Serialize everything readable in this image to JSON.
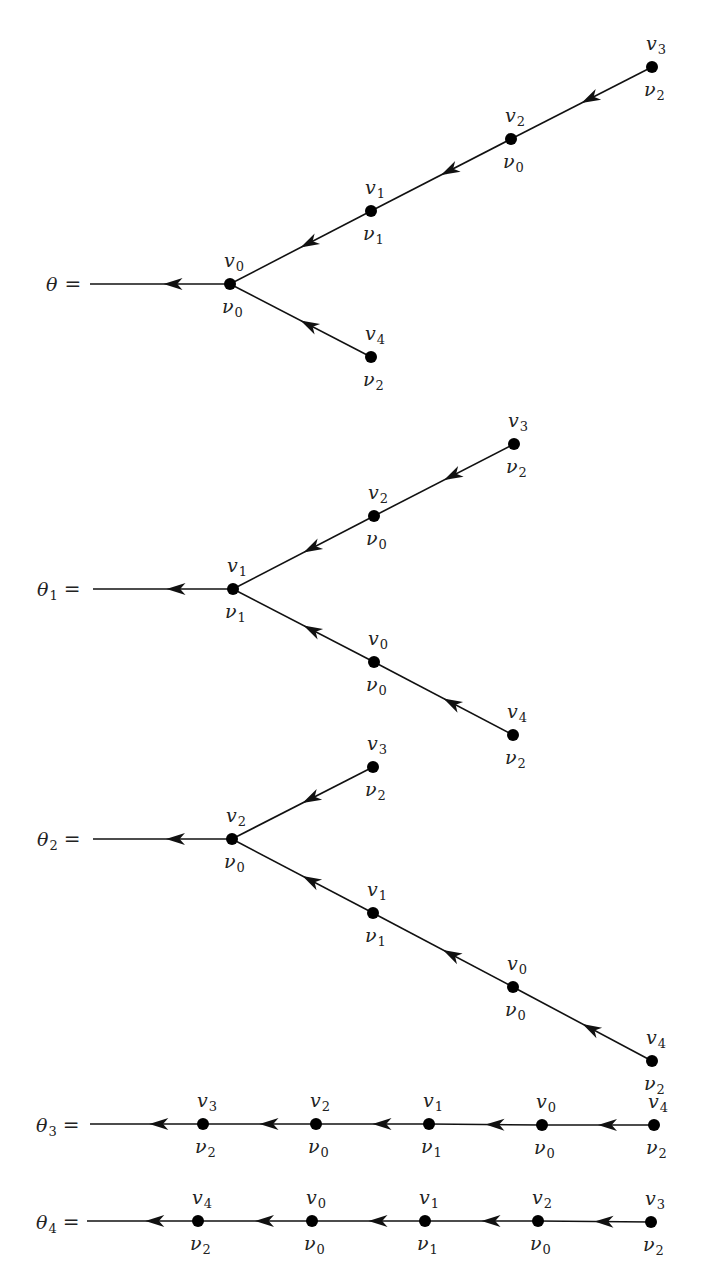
{
  "figure": {
    "colors": {
      "line": "#111111",
      "node": "#000000",
      "text": "#222222",
      "background": "#ffffff"
    },
    "node_radius": 6,
    "trees": [
      {
        "name": "theta",
        "label": {
          "symbol": "θ",
          "subscript": "",
          "eq": "=",
          "x": 46,
          "y": 291
        },
        "line_start": [
          90,
          284
        ],
        "nodes": [
          {
            "id": "v0",
            "x": 230,
            "y": 284,
            "top": {
              "symbol": "v",
              "sub": "0"
            },
            "bottom": {
              "symbol": "ν",
              "sub": "0"
            }
          },
          {
            "id": "v1",
            "x": 371,
            "y": 211,
            "top": {
              "symbol": "v",
              "sub": "1"
            },
            "bottom": {
              "symbol": "ν",
              "sub": "1"
            }
          },
          {
            "id": "v2",
            "x": 511,
            "y": 139,
            "top": {
              "symbol": "v",
              "sub": "2"
            },
            "bottom": {
              "symbol": "ν",
              "sub": "0"
            }
          },
          {
            "id": "v3",
            "x": 652,
            "y": 67,
            "top": {
              "symbol": "v",
              "sub": "3"
            },
            "bottom": {
              "symbol": "ν",
              "sub": "2"
            }
          },
          {
            "id": "v4",
            "x": 371,
            "y": 357,
            "top": {
              "symbol": "v",
              "sub": "4"
            },
            "bottom": {
              "symbol": "ν",
              "sub": "2"
            }
          }
        ],
        "edges": [
          {
            "from": "v1",
            "to": "v0"
          },
          {
            "from": "v2",
            "to": "v1"
          },
          {
            "from": "v3",
            "to": "v2"
          },
          {
            "from": "v4",
            "to": "v0"
          }
        ],
        "root": "v0"
      },
      {
        "name": "theta-1",
        "label": {
          "symbol": "θ",
          "subscript": "1",
          "eq": "=",
          "x": 37,
          "y": 596
        },
        "line_start": [
          93,
          589
        ],
        "nodes": [
          {
            "id": "v1",
            "x": 233,
            "y": 589,
            "top": {
              "symbol": "v",
              "sub": "1"
            },
            "bottom": {
              "symbol": "ν",
              "sub": "1"
            }
          },
          {
            "id": "v2",
            "x": 374,
            "y": 516,
            "top": {
              "symbol": "v",
              "sub": "2"
            },
            "bottom": {
              "symbol": "ν",
              "sub": "0"
            }
          },
          {
            "id": "v3",
            "x": 514,
            "y": 444,
            "top": {
              "symbol": "v",
              "sub": "3"
            },
            "bottom": {
              "symbol": "ν",
              "sub": "2"
            }
          },
          {
            "id": "v0",
            "x": 374,
            "y": 662,
            "top": {
              "symbol": "v",
              "sub": "0"
            },
            "bottom": {
              "symbol": "ν",
              "sub": "0"
            }
          },
          {
            "id": "v4",
            "x": 513,
            "y": 735,
            "top": {
              "symbol": "v",
              "sub": "4"
            },
            "bottom": {
              "symbol": "ν",
              "sub": "2"
            }
          }
        ],
        "edges": [
          {
            "from": "v2",
            "to": "v1"
          },
          {
            "from": "v3",
            "to": "v2"
          },
          {
            "from": "v0",
            "to": "v1"
          },
          {
            "from": "v4",
            "to": "v0"
          }
        ],
        "root": "v1"
      },
      {
        "name": "theta-2",
        "label": {
          "symbol": "θ",
          "subscript": "2",
          "eq": "=",
          "x": 37,
          "y": 846
        },
        "line_start": [
          93,
          839
        ],
        "nodes": [
          {
            "id": "v2",
            "x": 232,
            "y": 839,
            "top": {
              "symbol": "v",
              "sub": "2"
            },
            "bottom": {
              "symbol": "ν",
              "sub": "0"
            }
          },
          {
            "id": "v3",
            "x": 373,
            "y": 767,
            "top": {
              "symbol": "v",
              "sub": "3"
            },
            "bottom": {
              "symbol": "ν",
              "sub": "2"
            }
          },
          {
            "id": "v1",
            "x": 373,
            "y": 913,
            "top": {
              "symbol": "v",
              "sub": "1"
            },
            "bottom": {
              "symbol": "ν",
              "sub": "1"
            }
          },
          {
            "id": "v0",
            "x": 513,
            "y": 987,
            "top": {
              "symbol": "v",
              "sub": "0"
            },
            "bottom": {
              "symbol": "ν",
              "sub": "0"
            }
          },
          {
            "id": "v4",
            "x": 652,
            "y": 1061,
            "top": {
              "symbol": "v",
              "sub": "4"
            },
            "bottom": {
              "symbol": "ν",
              "sub": "2"
            }
          }
        ],
        "edges": [
          {
            "from": "v3",
            "to": "v2"
          },
          {
            "from": "v1",
            "to": "v2"
          },
          {
            "from": "v0",
            "to": "v1"
          },
          {
            "from": "v4",
            "to": "v0"
          }
        ],
        "root": "v2"
      },
      {
        "name": "theta-3",
        "label": {
          "symbol": "θ",
          "subscript": "3",
          "eq": "=",
          "x": 36,
          "y": 1132
        },
        "line_start": [
          90,
          1124
        ],
        "nodes": [
          {
            "id": "v3",
            "x": 203,
            "y": 1124,
            "top": {
              "symbol": "v",
              "sub": "3"
            },
            "bottom": {
              "symbol": "ν",
              "sub": "2"
            }
          },
          {
            "id": "v2",
            "x": 316,
            "y": 1124,
            "top": {
              "symbol": "v",
              "sub": "2"
            },
            "bottom": {
              "symbol": "ν",
              "sub": "0"
            }
          },
          {
            "id": "v1",
            "x": 429,
            "y": 1124,
            "top": {
              "symbol": "v",
              "sub": "1"
            },
            "bottom": {
              "symbol": "ν",
              "sub": "1"
            }
          },
          {
            "id": "v0",
            "x": 542,
            "y": 1125,
            "top": {
              "symbol": "v",
              "sub": "0"
            },
            "bottom": {
              "symbol": "ν",
              "sub": "0"
            }
          },
          {
            "id": "v4",
            "x": 654,
            "y": 1125,
            "top": {
              "symbol": "v",
              "sub": "4"
            },
            "bottom": {
              "symbol": "ν",
              "sub": "2"
            }
          }
        ],
        "edges": [
          {
            "from": "v2",
            "to": "v3"
          },
          {
            "from": "v1",
            "to": "v2"
          },
          {
            "from": "v0",
            "to": "v1"
          },
          {
            "from": "v4",
            "to": "v0"
          }
        ],
        "root": "v3"
      },
      {
        "name": "theta-4",
        "label": {
          "symbol": "θ",
          "subscript": "4",
          "eq": "=",
          "x": 36,
          "y": 1229
        },
        "line_start": [
          87,
          1221
        ],
        "nodes": [
          {
            "id": "v4",
            "x": 198,
            "y": 1221,
            "top": {
              "symbol": "v",
              "sub": "4"
            },
            "bottom": {
              "symbol": "ν",
              "sub": "2"
            }
          },
          {
            "id": "v0",
            "x": 312,
            "y": 1221,
            "top": {
              "symbol": "v",
              "sub": "0"
            },
            "bottom": {
              "symbol": "ν",
              "sub": "0"
            }
          },
          {
            "id": "v1",
            "x": 425,
            "y": 1221,
            "top": {
              "symbol": "v",
              "sub": "1"
            },
            "bottom": {
              "symbol": "ν",
              "sub": "1"
            }
          },
          {
            "id": "v2",
            "x": 538,
            "y": 1221,
            "top": {
              "symbol": "v",
              "sub": "2"
            },
            "bottom": {
              "symbol": "ν",
              "sub": "0"
            }
          },
          {
            "id": "v3",
            "x": 651,
            "y": 1222,
            "top": {
              "symbol": "v",
              "sub": "3"
            },
            "bottom": {
              "symbol": "ν",
              "sub": "2"
            }
          }
        ],
        "edges": [
          {
            "from": "v0",
            "to": "v4"
          },
          {
            "from": "v1",
            "to": "v0"
          },
          {
            "from": "v2",
            "to": "v1"
          },
          {
            "from": "v3",
            "to": "v2"
          }
        ],
        "root": "v4"
      }
    ]
  }
}
